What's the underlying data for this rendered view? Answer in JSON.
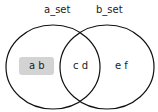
{
  "diagram": {
    "type": "venn",
    "sets": [
      {
        "name": "a_set",
        "only": "a b",
        "highlighted": true
      },
      {
        "name": "b_set",
        "only": "e f",
        "highlighted": false
      }
    ],
    "intersection": "c d",
    "colors": {
      "stroke": "#111111",
      "highlight": "#d3d3d3"
    }
  }
}
